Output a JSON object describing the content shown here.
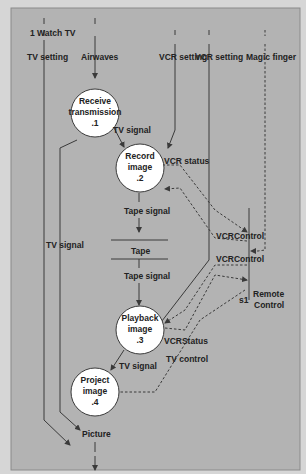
{
  "diagram": {
    "title": "1 Watch TV",
    "type": "data-flow-diagram",
    "colors": {
      "background": "#b3b3b3",
      "frame": "#d6d6d6",
      "line": "#3a3a3a",
      "process_fill": "#ffffff",
      "text": "#222222"
    },
    "sources": {
      "tv_setting": "TV setting",
      "airwaves": "Airwaves",
      "vcr_setting_1": "VCR setting",
      "vcr_setting_2": "VCR setting",
      "magic_finger": "Magic finger"
    },
    "processes": [
      {
        "id": ".1",
        "line1": "Receive",
        "line2": "transmission",
        "number": ".1"
      },
      {
        "id": ".2",
        "line1": "Record",
        "line2": "image",
        "number": ".2"
      },
      {
        "id": ".3",
        "line1": "Playback",
        "line2": "image",
        "number": ".3"
      },
      {
        "id": ".4",
        "line1": "Project",
        "line2": "image",
        "number": ".4"
      }
    ],
    "data_store": {
      "label": "Tape"
    },
    "external_entity": {
      "id": "s1",
      "line1": "Remote",
      "line2": "Control"
    },
    "flows": {
      "tv_signal_1_2": "TV signal",
      "vcr_status": "VCR status",
      "tape_signal_in": "Tape signal",
      "tape_signal_out": "Tape signal",
      "tv_signal_left": "TV signal",
      "vcr_control_1": "VCRControl",
      "vcr_control_2": "VCRControl",
      "vcr_status_3": "VCRStatus",
      "tv_control": "TV control",
      "tv_signal_3_4": "TV signal",
      "picture": "Picture"
    }
  }
}
